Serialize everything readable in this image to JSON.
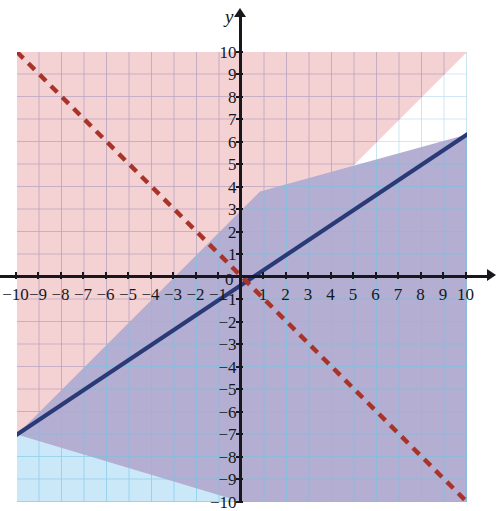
{
  "figure": {
    "type": "coordinate-plane-inequality-graph",
    "axis_labels": {
      "y": "y",
      "x": ""
    },
    "origin_label": "0",
    "x_ticks": [
      "-10",
      "-9",
      "-8",
      "-7",
      "-6",
      "-5",
      "-4",
      "-3",
      "-2",
      "-1",
      "1",
      "2",
      "3",
      "4",
      "5",
      "6",
      "7",
      "8",
      "9",
      "10"
    ],
    "y_ticks": [
      "10",
      "9",
      "8",
      "7",
      "6",
      "5",
      "4",
      "3",
      "2",
      "1",
      "-1",
      "-2",
      "-3",
      "-4",
      "-5",
      "-6",
      "-7",
      "-8",
      "-9",
      "-10"
    ],
    "xlim": [
      -10,
      10
    ],
    "ylim": [
      -10,
      10
    ]
  },
  "chart_data": {
    "type": "line",
    "title": "",
    "xlabel": "",
    "ylabel": "y",
    "xlim": [
      -10,
      10
    ],
    "ylim": [
      -10,
      10
    ],
    "grid": true,
    "legend": "none",
    "series": [
      {
        "name": "solid-blue-boundary",
        "equation": "y = (2/3)x + 3",
        "slope": 0.6666667,
        "intercept": 3,
        "style": "solid",
        "color": "#2a3a77",
        "endpoints": [
          [
            -10,
            -3.67
          ],
          [
            10,
            9.67
          ]
        ],
        "shaded_side": "below",
        "shade_color": "#bfe3f6"
      },
      {
        "name": "dashed-red-boundary",
        "equation": "y = -x",
        "slope": -1,
        "intercept": 0,
        "style": "dashed",
        "color": "#a83328",
        "endpoints": [
          [
            -10,
            10
          ],
          [
            10,
            -10
          ]
        ],
        "shaded_side": "above",
        "shade_color": "#f2cfd1"
      }
    ],
    "regions": {
      "blue_only": "#cbe8f8",
      "pink_only": "#f4d2d4",
      "overlap_purple": "#b3aed2",
      "unshaded": "#ffffff"
    }
  },
  "colors": {
    "axis": "#17171c",
    "grid_blue": "#7fc4e8",
    "grid_purple": "#8a8ab0",
    "grid_pink": "#c9a7b4",
    "blue_line": "#2a3a77",
    "red_line": "#a83328",
    "page_background": "#ffffff"
  }
}
